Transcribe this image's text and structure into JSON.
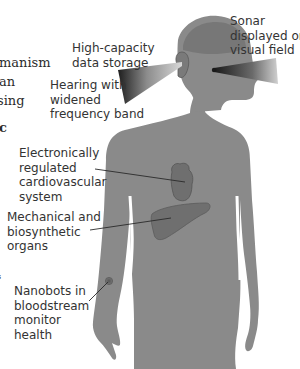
{
  "left_column_fragments": [
    {
      "text": "manism",
      "bold": false
    },
    {
      "text": "an",
      "bold": false
    },
    {
      "text": "sing",
      "bold": false
    },
    {
      "text": "c",
      "bold": true
    },
    {
      "text": "s",
      "bold": false
    }
  ],
  "labels": {
    "data_storage": [
      "High-capacity",
      "data storage"
    ],
    "sonar": [
      "Sonar",
      "displayed on",
      "visual field"
    ],
    "hearing": [
      "Hearing with",
      "widened",
      "frequency band"
    ],
    "cardio": [
      "Electronically",
      "regulated",
      "cardiovascular",
      "system"
    ],
    "organs": [
      "Mechanical and",
      "biosynthetic",
      "organs"
    ],
    "nanobots": [
      "Nanobots in",
      "bloodstream",
      "monitor",
      "health"
    ]
  },
  "colors": {
    "background": "#ffffff",
    "body_fill": "#8a8a8a",
    "brain_fill": "#7a7a7a",
    "organ_fill": "#6f6f6f",
    "text": "#333333",
    "leader_line": "#2a2a2a"
  }
}
